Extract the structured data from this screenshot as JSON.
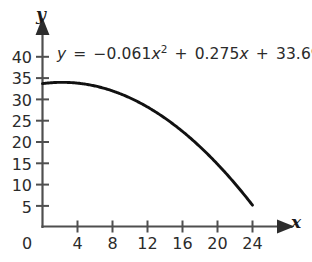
{
  "chart_data": {
    "type": "line",
    "title": "",
    "subtitle": "",
    "xlabel": "x",
    "ylabel": "y",
    "equation_text": "y = −0.061x² + 0.275x + 33.698",
    "equation_parts": {
      "lhs": "y",
      "equals": "=",
      "term1_coef": "−0.061",
      "term1_var": "x",
      "term1_exp": "2",
      "plus1": "+",
      "term2_coef": "0.275",
      "term2_var": "x",
      "plus2": "+",
      "constant": "33.698"
    },
    "coefficients": {
      "a": -0.061,
      "b": 0.275,
      "c": 33.698
    },
    "xlim": [
      0,
      27.5
    ],
    "ylim": [
      0,
      43
    ],
    "xticks": [
      0,
      4,
      8,
      12,
      16,
      20,
      24
    ],
    "xtick_labels": [
      "0",
      "4",
      "8",
      "12",
      "16",
      "20",
      "24"
    ],
    "yticks": [
      5,
      10,
      15,
      20,
      25,
      30,
      35,
      40
    ],
    "ytick_labels": [
      "5",
      "10",
      "15",
      "20",
      "25",
      "30",
      "35",
      "40"
    ],
    "grid": false,
    "legend": null,
    "domain_drawn": [
      0,
      24
    ],
    "x": [
      0,
      2,
      4,
      6,
      8,
      10,
      12,
      14,
      16,
      18,
      20,
      22,
      24
    ],
    "y": [
      33.7,
      34.0,
      33.8,
      33.2,
      31.99,
      30.35,
      28.32,
      25.9,
      23.1,
      19.9,
      16.3,
      12.3,
      7.96
    ],
    "annotations": [
      {
        "text": "y = −0.061x² + 0.275x + 33.698",
        "position": "upper-left-inside"
      }
    ],
    "colors": {
      "curve": "#111111",
      "axis": "#4f4f4f",
      "text": "#2b2b2b",
      "background": "#ffffff"
    }
  },
  "axes": {
    "y_label": "y",
    "x_label": "x"
  }
}
